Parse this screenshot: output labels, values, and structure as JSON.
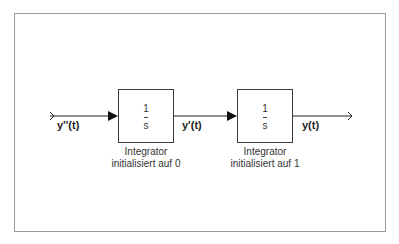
{
  "diagram": {
    "type": "block_diagram",
    "colors": {
      "line": "#222222",
      "frame": "#9a9a9a",
      "text": "#333333"
    },
    "signals": {
      "input": "y''(t)",
      "middle": "y'(t)",
      "output": "y(t)"
    },
    "blocks": [
      {
        "numerator": "1",
        "denominator": "s",
        "caption_line1": "Integrator",
        "caption_line2": "initialisiert auf 0"
      },
      {
        "numerator": "1",
        "denominator": "s",
        "caption_line1": "Integrator",
        "caption_line2": "initialisiert auf 1"
      }
    ]
  }
}
